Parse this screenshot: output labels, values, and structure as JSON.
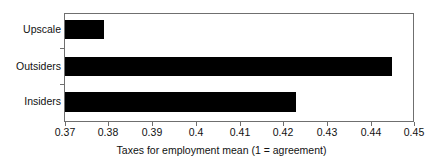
{
  "chart_data": {
    "type": "bar",
    "orientation": "horizontal",
    "title": "",
    "subtitle": "",
    "xlabel": "Taxes for employment mean (1 = agreement)",
    "ylabel": "",
    "categories": [
      "Insiders",
      "Outsiders",
      "Upscale"
    ],
    "values": [
      0.423,
      0.445,
      0.379
    ],
    "series": [
      {
        "name": "Taxes for employment mean",
        "values": [
          0.423,
          0.445,
          0.379
        ]
      }
    ],
    "xlim": [
      0.37,
      0.45
    ],
    "xticks": [
      0.37,
      0.38,
      0.39,
      0.4,
      0.41,
      0.42,
      0.43,
      0.44,
      0.45
    ],
    "xtick_labels": [
      "0.37",
      "0.38",
      "0.39",
      "0.4",
      "0.41",
      "0.42",
      "0.43",
      "0.44",
      "0.45"
    ],
    "grid": false,
    "legend": false,
    "legend_position": "none",
    "bar_color": "#000000",
    "frame_color": "#6f6f6f",
    "background_color": "#ffffff",
    "annotations": []
  },
  "axis": {
    "x_title": "Taxes for employment mean (1 = agreement)",
    "tick_0": "0.37",
    "tick_1": "0.38",
    "tick_2": "0.39",
    "tick_3": "0.4",
    "tick_4": "0.41",
    "tick_5": "0.42",
    "tick_6": "0.43",
    "tick_7": "0.44",
    "tick_8": "0.45"
  },
  "categories": {
    "upscale": "Upscale",
    "outsiders": "Outsiders",
    "insiders": "Insiders"
  }
}
